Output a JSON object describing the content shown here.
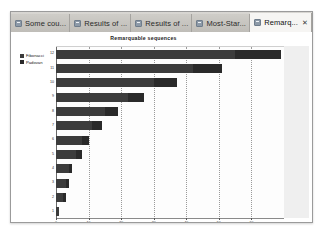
{
  "window": {
    "tabs": [
      {
        "label": "Some cou...",
        "icon": "page-favicon",
        "active": false,
        "closable": false
      },
      {
        "label": "Results of ...",
        "icon": "page-favicon",
        "active": false,
        "closable": false
      },
      {
        "label": "Results of ...",
        "icon": "page-favicon",
        "active": false,
        "closable": false
      },
      {
        "label": "Most-Star...",
        "icon": "page-favicon",
        "active": false,
        "closable": false
      },
      {
        "label": "Remarq...",
        "icon": "page-favicon",
        "active": true,
        "closable": true,
        "close_glyph": "✕"
      }
    ]
  },
  "colors": {
    "series_1": "#3c3c3c",
    "series_2": "#2a2a2a",
    "plot_background": "#fdfdfd",
    "right_margin": "#efefef",
    "gridline": "#9a9a9a"
  },
  "chart_data": {
    "type": "bar",
    "orientation": "horizontal",
    "stacked": true,
    "title": "Remarquable sequences",
    "xlabel": "",
    "ylabel": "",
    "grid": true,
    "legend_position": "top-left",
    "xlim": [
      0,
      70
    ],
    "xticks": [
      0,
      10,
      20,
      30,
      40,
      50,
      60
    ],
    "categories": [
      "12",
      "11",
      "10",
      "9",
      "8",
      "7",
      "6",
      "5",
      "4",
      "3",
      "2",
      "1"
    ],
    "series": [
      {
        "name": "Fibonacci",
        "values": [
          55,
          42,
          30,
          22,
          15,
          11,
          8,
          6,
          4,
          3,
          2,
          1
        ]
      },
      {
        "name": "Padovan",
        "values": [
          14,
          9,
          7,
          5,
          4,
          3,
          2,
          2,
          1,
          1,
          1,
          0
        ]
      }
    ]
  }
}
